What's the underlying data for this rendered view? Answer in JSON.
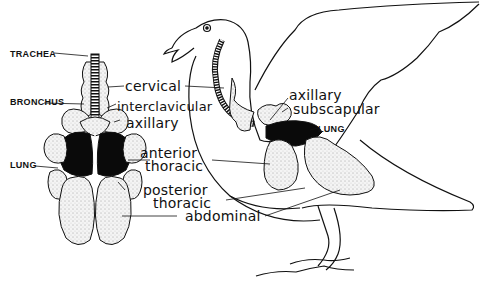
{
  "diagram": {
    "left_view": {
      "labels": {
        "trachea": "TRACHEA",
        "bronchus": "BRONCHUS",
        "lung": "LUNG"
      }
    },
    "shared_labels": {
      "cervical": "cervical",
      "interclavicular": "interclavicular",
      "axillary": "axillary",
      "anterior_thoracic_1": "anterior",
      "anterior_thoracic_2": "thoracic",
      "posterior_thoracic_1": "posterior",
      "posterior_thoracic_2": "thoracic",
      "abdominal": "abdominal"
    },
    "bird_view": {
      "labels": {
        "axillary": "axillary",
        "subscapular": "subscapular",
        "lung": "LUNG"
      }
    },
    "colors": {
      "ink": "#111111",
      "background": "#ffffff",
      "air_sac_fill": "#f2f2f2",
      "lung_fill": "#0a0a0a"
    }
  }
}
